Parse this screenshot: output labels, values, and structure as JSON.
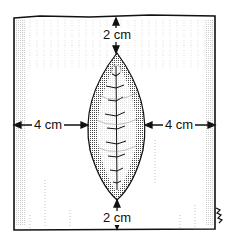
{
  "diagram": {
    "labels": {
      "top_margin": "2 cm",
      "bottom_margin": "2 cm",
      "left_margin": "4 cm",
      "right_margin": "4 cm"
    },
    "colors": {
      "ink": "#111111",
      "shading": "#555555",
      "background": "#ffffff"
    }
  }
}
